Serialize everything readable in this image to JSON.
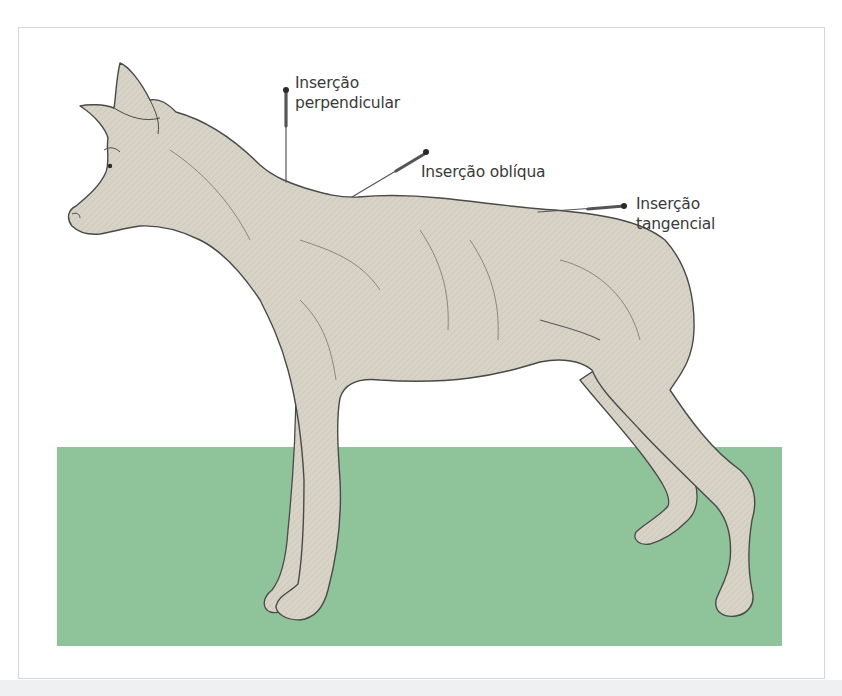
{
  "figure": {
    "colors": {
      "ground": "#8fc39a",
      "body_fill": "#d7d3c6",
      "outline": "#4a4a48",
      "label_text": "#3a3a3a",
      "frame_border": "#d6d6d6"
    },
    "labels": {
      "perpendicular": {
        "line1": "Inserção",
        "line2": "perpendicular"
      },
      "oblique": {
        "line1": "Inserção oblíqua"
      },
      "tangential": {
        "line1": "Inserção",
        "line2": "tangencial"
      }
    }
  }
}
